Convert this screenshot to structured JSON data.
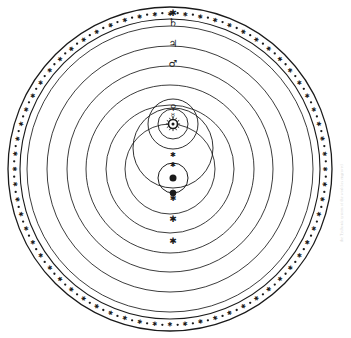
{
  "figure": {
    "background_color": "#ffffff",
    "ink_color": "#1a1a1a",
    "width": 351,
    "height": 338,
    "caption_text": "the Tychonic system of the world as engraved"
  },
  "stellar_band": {
    "name": "sphere-of-fixed-stars",
    "center_x": 170,
    "center_y": 169,
    "outer_radius": 162,
    "inner_radius": 150,
    "star_count": 64,
    "star_glyph": "asterisk",
    "dot_glyph": "point",
    "stroke_color": "#1a1a1a"
  },
  "orbits": [
    {
      "name": "saturn-orbit",
      "label": "Saturn",
      "symbol": "♄",
      "radius": 143,
      "symbol_angle_deg": -90,
      "marker": "none"
    },
    {
      "name": "jupiter-orbit",
      "label": "Jupiter",
      "symbol": "♃",
      "radius": 123,
      "symbol_angle_deg": -90,
      "marker": "none"
    },
    {
      "name": "mars-orbit",
      "label": "Mars",
      "symbol": "♂",
      "radius": 103,
      "symbol_angle_deg": -90,
      "marker": "none"
    },
    {
      "name": "sun-orbit-outer",
      "label": "Sun path outer",
      "radius": 84,
      "symbol": "",
      "symbol_angle_deg": 90,
      "marker": "star"
    },
    {
      "name": "sun-orbit-mid",
      "label": "Sun path mid",
      "radius": 64,
      "symbol": "",
      "symbol_angle_deg": 90,
      "marker": "star"
    },
    {
      "name": "sun-orbit-inner",
      "label": "Sun path inner",
      "radius": 45,
      "symbol": "",
      "symbol_angle_deg": 90,
      "marker": "star"
    }
  ],
  "solar_system": {
    "sun": {
      "name": "sun-body",
      "symbol": "☉",
      "label": "Sun",
      "center_x": 173,
      "center_y": 124,
      "radius": 4.5
    },
    "venus_orbit": {
      "name": "venus-orbit",
      "label": "Venus",
      "symbol": "♀",
      "center_x": 173,
      "center_y": 124,
      "radius": 25,
      "symbol_angle_deg": -90
    },
    "mercury_orbit": {
      "name": "mercury-orbit",
      "label": "Mercury",
      "symbol": "☿",
      "center_x": 173,
      "center_y": 124,
      "radius": 15,
      "symbol_angle_deg": -90
    },
    "venus_marker": {
      "name": "venus-marker",
      "symbol": "♀",
      "x": 173,
      "y": 149
    },
    "mercury_marker": {
      "name": "mercury-marker",
      "symbol": "☿",
      "x": 173,
      "y": 139
    }
  },
  "earth_system": {
    "deferent": {
      "name": "earth-deferent-circle",
      "label": "Earth sphere",
      "center_x": 173,
      "center_y": 148,
      "radius": 40
    },
    "moon_orbit": {
      "name": "moon-orbit",
      "label": "Moon orbit",
      "center_x": 173,
      "center_y": 178,
      "radius": 15
    },
    "earth": {
      "name": "earth-body",
      "label": "Earth",
      "center_x": 173,
      "center_y": 178,
      "radius": 3.5
    },
    "moon": {
      "name": "moon-body",
      "label": "Moon",
      "symbol": "☽",
      "center_x": 173,
      "center_y": 193,
      "radius": 3
    }
  },
  "axis_markers": [
    {
      "name": "marker-saturn-node",
      "glyph": "✱",
      "x": 173,
      "y": 13,
      "size": 9
    },
    {
      "name": "marker-node-a",
      "glyph": "✱",
      "x": 173,
      "y": 155,
      "size": 7
    },
    {
      "name": "marker-node-b",
      "glyph": "✱",
      "x": 173,
      "y": 165,
      "size": 7
    },
    {
      "name": "marker-node-c",
      "glyph": "✱",
      "x": 173,
      "y": 198,
      "size": 8
    },
    {
      "name": "marker-node-d",
      "glyph": "✱",
      "x": 173,
      "y": 219,
      "size": 9
    },
    {
      "name": "marker-node-e",
      "glyph": "✱",
      "x": 173,
      "y": 241,
      "size": 9
    }
  ],
  "planet_symbols": [
    {
      "name": "saturn-symbol",
      "glyph": "♄",
      "x": 173,
      "y": 22,
      "size": 11,
      "label": "Saturn"
    },
    {
      "name": "jupiter-symbol",
      "glyph": "♃",
      "x": 173,
      "y": 43,
      "size": 10,
      "label": "Jupiter"
    },
    {
      "name": "mars-symbol",
      "glyph": "♂",
      "x": 173,
      "y": 63,
      "size": 10,
      "label": "Mars"
    },
    {
      "name": "venus-symbol",
      "glyph": "♀",
      "x": 173,
      "y": 107,
      "size": 8,
      "label": "Venus"
    },
    {
      "name": "mercury-symbol",
      "glyph": "☿",
      "x": 173,
      "y": 116,
      "size": 7,
      "label": "Mercury"
    }
  ]
}
